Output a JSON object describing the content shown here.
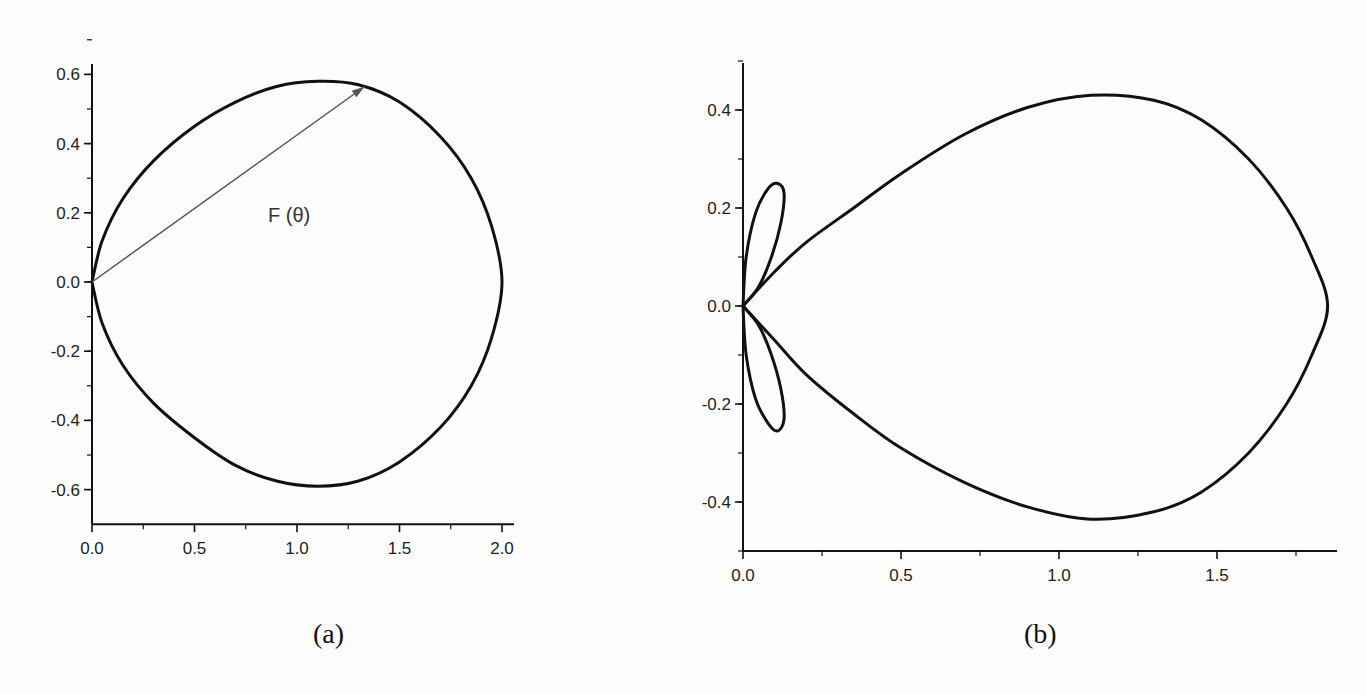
{
  "figure": {
    "panels": [
      {
        "id": "a",
        "label": "(a)"
      },
      {
        "id": "b",
        "label": "(b)"
      }
    ]
  },
  "chart_data": [
    {
      "type": "line",
      "subtype": "polar-pattern-cartesian",
      "title": "",
      "panel_label": "(a)",
      "xlabel": "",
      "ylabel": "",
      "xlim": [
        0.0,
        2.2
      ],
      "ylim": [
        -0.7,
        0.7
      ],
      "x_ticks": [
        "0.0",
        "0.5",
        "1.0",
        "1.5",
        "2.0"
      ],
      "y_ticks": [
        "-0.6",
        "-0.4",
        "-0.2",
        "0.0",
        "0.2",
        "0.4",
        "0.6"
      ],
      "grid": false,
      "legend": null,
      "annotations": [
        {
          "text": "F (θ)",
          "type": "arrow",
          "from": [
            0.0,
            0.0
          ],
          "to": [
            1.33,
            0.565
          ]
        }
      ],
      "description": "Closed teardrop / cardioid-like radiation pattern starting at origin, max x ≈ 2.0 at y=0, max |y| ≈ 0.58 near x ≈ 1.1",
      "series": [
        {
          "name": "F(θ)",
          "points": [
            [
              0.0,
              0.0
            ],
            [
              0.05,
              0.12
            ],
            [
              0.15,
              0.24
            ],
            [
              0.3,
              0.35
            ],
            [
              0.5,
              0.45
            ],
            [
              0.7,
              0.52
            ],
            [
              0.9,
              0.565
            ],
            [
              1.1,
              0.58
            ],
            [
              1.3,
              0.57
            ],
            [
              1.5,
              0.52
            ],
            [
              1.7,
              0.42
            ],
            [
              1.85,
              0.3
            ],
            [
              1.95,
              0.16
            ],
            [
              2.0,
              0.0
            ],
            [
              1.95,
              -0.16
            ],
            [
              1.85,
              -0.3
            ],
            [
              1.7,
              -0.42
            ],
            [
              1.5,
              -0.52
            ],
            [
              1.3,
              -0.575
            ],
            [
              1.1,
              -0.59
            ],
            [
              0.9,
              -0.575
            ],
            [
              0.7,
              -0.53
            ],
            [
              0.5,
              -0.45
            ],
            [
              0.3,
              -0.35
            ],
            [
              0.15,
              -0.24
            ],
            [
              0.05,
              -0.12
            ],
            [
              0.0,
              0.0
            ]
          ]
        }
      ]
    },
    {
      "type": "line",
      "subtype": "polar-pattern-cartesian",
      "title": "",
      "panel_label": "(b)",
      "xlabel": "",
      "ylabel": "",
      "xlim": [
        0.0,
        1.9
      ],
      "ylim": [
        -0.5,
        0.5
      ],
      "x_ticks": [
        "0.0",
        "0.5",
        "1.0",
        "1.5"
      ],
      "y_ticks": [
        "-0.4",
        "-0.2",
        "0.0",
        "0.2",
        "0.4"
      ],
      "grid": false,
      "legend": null,
      "description": "Main lobe reaching x ≈ 1.85 with |y| max ≈ 0.43 near x ≈ 1.1, plus two small side lobes near origin peaking at (≈0.12, ±0.25)",
      "series": [
        {
          "name": "main-lobe",
          "points": [
            [
              0.0,
              0.0
            ],
            [
              0.1,
              0.07
            ],
            [
              0.2,
              0.13
            ],
            [
              0.35,
              0.2
            ],
            [
              0.5,
              0.27
            ],
            [
              0.7,
              0.35
            ],
            [
              0.9,
              0.405
            ],
            [
              1.1,
              0.43
            ],
            [
              1.3,
              0.42
            ],
            [
              1.45,
              0.38
            ],
            [
              1.6,
              0.3
            ],
            [
              1.72,
              0.2
            ],
            [
              1.8,
              0.1
            ],
            [
              1.85,
              0.0
            ],
            [
              1.8,
              -0.1
            ],
            [
              1.72,
              -0.2
            ],
            [
              1.6,
              -0.3
            ],
            [
              1.45,
              -0.38
            ],
            [
              1.3,
              -0.42
            ],
            [
              1.1,
              -0.435
            ],
            [
              0.9,
              -0.41
            ],
            [
              0.7,
              -0.36
            ],
            [
              0.5,
              -0.29
            ],
            [
              0.35,
              -0.22
            ],
            [
              0.2,
              -0.14
            ],
            [
              0.1,
              -0.07
            ],
            [
              0.0,
              0.0
            ]
          ]
        },
        {
          "name": "side-lobe-upper",
          "points": [
            [
              0.0,
              0.0
            ],
            [
              0.01,
              0.1
            ],
            [
              0.04,
              0.19
            ],
            [
              0.08,
              0.24
            ],
            [
              0.11,
              0.25
            ],
            [
              0.13,
              0.23
            ],
            [
              0.12,
              0.17
            ],
            [
              0.09,
              0.1
            ],
            [
              0.05,
              0.04
            ],
            [
              0.0,
              0.0
            ]
          ]
        },
        {
          "name": "side-lobe-lower",
          "points": [
            [
              0.0,
              0.0
            ],
            [
              0.01,
              -0.1
            ],
            [
              0.04,
              -0.19
            ],
            [
              0.08,
              -0.24
            ],
            [
              0.11,
              -0.255
            ],
            [
              0.13,
              -0.23
            ],
            [
              0.12,
              -0.17
            ],
            [
              0.09,
              -0.1
            ],
            [
              0.05,
              -0.04
            ],
            [
              0.0,
              0.0
            ]
          ]
        }
      ]
    }
  ]
}
